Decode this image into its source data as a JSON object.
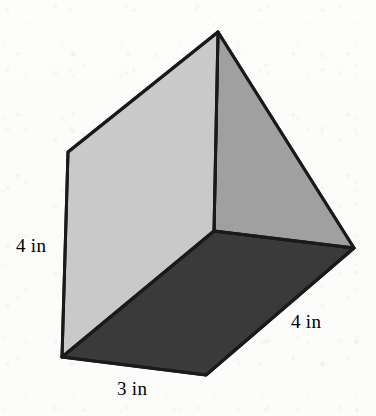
{
  "figure": {
    "name": "rectangular prism",
    "kind": "3d-solid-diagram",
    "projection": "oblique",
    "background_color": "#fdfdfc",
    "outline_color": "#1a1a1a",
    "outline_width": 3,
    "units": "in",
    "faces": [
      {
        "id": "left-face",
        "name": "front-left-face",
        "shade": "light",
        "color": "#c9c9c9",
        "points": "68,152 218,32 214,231 62,357"
      },
      {
        "id": "right-face",
        "name": "right-side-face",
        "shade": "medium",
        "color": "#a0a0a0",
        "points": "218,32 354,248 214,231"
      },
      {
        "id": "bottom-face",
        "name": "bottom-face",
        "shade": "dark",
        "color": "#3a3a3a",
        "points": "62,357 214,231 354,248 206,375"
      }
    ],
    "vertices": {
      "apex_top": "218,32",
      "upper_left": "68,152",
      "interior_center": "214,231",
      "right": "354,248",
      "lower_left": "62,357",
      "bottom_front": "206,375"
    },
    "edges": [
      {
        "name": "edge-upper-left-to-apex",
        "from": "68,152",
        "to": "218,32"
      },
      {
        "name": "edge-apex-to-right",
        "from": "218,32",
        "to": "354,248"
      },
      {
        "name": "edge-apex-to-interior",
        "from": "218,32",
        "to": "214,231"
      },
      {
        "name": "edge-upper-left-to-lower-left",
        "from": "68,152",
        "to": "62,357"
      },
      {
        "name": "edge-interior-to-lower-left",
        "from": "214,231",
        "to": "62,357"
      },
      {
        "name": "edge-interior-to-right",
        "from": "214,231",
        "to": "354,248"
      },
      {
        "name": "edge-lower-left-to-bottom-front",
        "from": "62,357",
        "to": "206,375"
      },
      {
        "name": "edge-bottom-front-to-right",
        "from": "206,375",
        "to": "354,248"
      }
    ]
  },
  "labels": {
    "height": "4 in",
    "depth_front": "3 in",
    "depth_right": "4 in"
  },
  "measurements": {
    "height_value": 4,
    "front_edge_value": 3,
    "right_edge_value": 4,
    "unit": "in"
  }
}
